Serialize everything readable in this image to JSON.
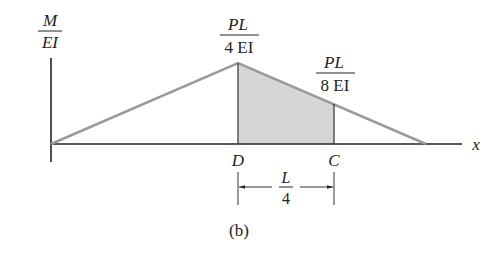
{
  "diagram": {
    "caption": "(b)",
    "y_axis_label": {
      "numerator": "M",
      "denominator": "EI"
    },
    "x_axis_label": "x",
    "peak_label": {
      "numerator": "PL",
      "denominator": "4 EI"
    },
    "c_value_label": {
      "numerator": "PL",
      "denominator": "8 EI"
    },
    "point_d": "D",
    "point_c": "C",
    "dimension": {
      "numerator": "L",
      "denominator": "4"
    },
    "colors": {
      "line": "#9a9a9a",
      "axis": "#222222",
      "shade": "#d6d6d6"
    }
  }
}
